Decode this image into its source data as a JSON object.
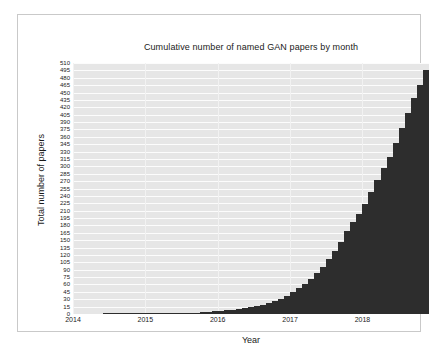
{
  "chart_data": {
    "type": "bar",
    "title": "Cumulative number of named GAN papers by month",
    "xlabel": "Year",
    "ylabel": "Total number of papers",
    "ylim": [
      0,
      510
    ],
    "ytick_step": 15,
    "yticks": [
      0,
      15,
      30,
      45,
      60,
      75,
      90,
      105,
      120,
      135,
      150,
      165,
      180,
      195,
      210,
      225,
      240,
      255,
      270,
      285,
      300,
      315,
      330,
      345,
      360,
      375,
      390,
      405,
      420,
      435,
      450,
      465,
      480,
      495,
      510
    ],
    "xticks": [
      "2014",
      "2015",
      "2016",
      "2017",
      "2018"
    ],
    "xtick_values": [
      2014,
      2015,
      2016,
      2017,
      2018
    ],
    "xlim": [
      2014.0,
      2018.92
    ],
    "grid": true,
    "legend": null,
    "bar_color": "#2d2d2d",
    "plot_background": "#e6e6e6",
    "gridline_color": "#fcfcfc",
    "figure_background": "#ffffff",
    "categories": [
      "2014-01",
      "2014-02",
      "2014-03",
      "2014-04",
      "2014-05",
      "2014-06",
      "2014-07",
      "2014-08",
      "2014-09",
      "2014-10",
      "2014-11",
      "2014-12",
      "2015-01",
      "2015-02",
      "2015-03",
      "2015-04",
      "2015-05",
      "2015-06",
      "2015-07",
      "2015-08",
      "2015-09",
      "2015-10",
      "2015-11",
      "2015-12",
      "2016-01",
      "2016-02",
      "2016-03",
      "2016-04",
      "2016-05",
      "2016-06",
      "2016-07",
      "2016-08",
      "2016-09",
      "2016-10",
      "2016-11",
      "2016-12",
      "2017-01",
      "2017-02",
      "2017-03",
      "2017-04",
      "2017-05",
      "2017-06",
      "2017-07",
      "2017-08",
      "2017-09",
      "2017-10",
      "2017-11",
      "2017-12",
      "2018-01",
      "2018-02",
      "2018-03",
      "2018-04",
      "2018-05",
      "2018-06",
      "2018-07",
      "2018-08",
      "2018-09",
      "2018-10",
      "2018-11"
    ],
    "values": [
      0,
      0,
      0,
      0,
      0,
      1,
      1,
      1,
      1,
      1,
      1,
      1,
      1,
      1,
      2,
      2,
      2,
      2,
      3,
      3,
      3,
      4,
      5,
      6,
      7,
      8,
      9,
      10,
      12,
      14,
      16,
      19,
      22,
      26,
      31,
      37,
      44,
      52,
      61,
      71,
      83,
      96,
      111,
      128,
      147,
      168,
      186,
      203,
      224,
      248,
      272,
      296,
      320,
      348,
      378,
      408,
      438,
      465,
      495
    ],
    "max_value": 495,
    "final_value": 495
  }
}
